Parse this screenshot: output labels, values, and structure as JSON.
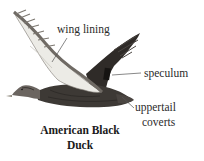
{
  "diagram": {
    "title_line1": "American Black",
    "title_line2": "Duck",
    "labels": [
      {
        "id": "wing-lining",
        "text": "wing lining"
      },
      {
        "id": "speculum",
        "text": "speculum"
      },
      {
        "id": "uppertail-line1",
        "text": "uppertail"
      },
      {
        "id": "uppertail-line2",
        "text": "coverts"
      }
    ],
    "colors": {
      "background": "#ffffff",
      "body_dark": "#3a3632",
      "wing_lining": "#ecebe6",
      "leader_line": "#555555",
      "text": "#2b2b2b"
    }
  }
}
